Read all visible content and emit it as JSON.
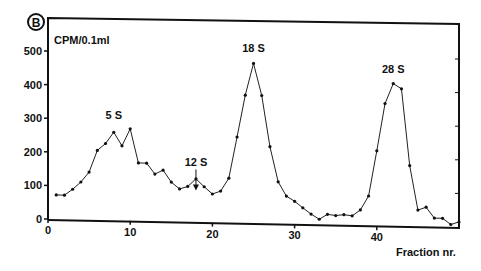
{
  "chart_data": {
    "type": "line",
    "title": "",
    "panel_label": "B",
    "xlabel": "Fraction nr.",
    "ylabel": "CPM/0.1ml",
    "xlim": [
      0,
      50
    ],
    "ylim": [
      0,
      500
    ],
    "x_ticks": [
      0,
      10,
      20,
      30,
      40
    ],
    "y_ticks": [
      0,
      100,
      200,
      300,
      400,
      500
    ],
    "grid": false,
    "legend": null,
    "marker": "dot",
    "x": [
      1,
      2,
      3,
      4,
      5,
      6,
      7,
      8,
      9,
      10,
      11,
      12,
      13,
      14,
      15,
      16,
      17,
      18,
      19,
      20,
      21,
      22,
      23,
      24,
      25,
      26,
      27,
      28,
      29,
      30,
      31,
      32,
      33,
      34,
      35,
      36,
      37,
      38,
      39,
      40,
      41,
      42,
      43,
      44,
      45,
      46,
      47,
      48,
      49,
      50
    ],
    "series": [
      {
        "name": "CPM/0.1ml",
        "values": [
          72,
          72,
          90,
          112,
          142,
          207,
          228,
          262,
          222,
          273,
          172,
          172,
          140,
          152,
          117,
          97,
          105,
          128,
          105,
          84,
          93,
          132,
          255,
          380,
          475,
          380,
          228,
          124,
          82,
          67,
          48,
          30,
          15,
          30,
          27,
          30,
          27,
          45,
          87,
          222,
          363,
          423,
          408,
          180,
          48,
          57,
          25,
          25,
          7,
          15
        ]
      }
    ],
    "annotations": [
      {
        "text": "5 S",
        "x": 8,
        "y": 300
      },
      {
        "text": "12 S",
        "x": 18,
        "y": 165,
        "arrow": true
      },
      {
        "text": "18 S",
        "x": 25,
        "y": 510
      },
      {
        "text": "28 S",
        "x": 42,
        "y": 455
      }
    ]
  }
}
